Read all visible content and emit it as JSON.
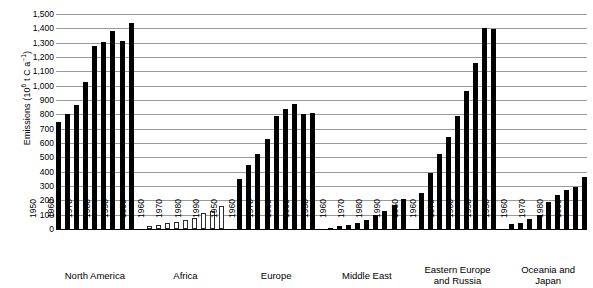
{
  "chart_data": {
    "type": "bar",
    "title": "",
    "xlabel": "",
    "ylabel": "Emissions (10⁶ t C a⁻¹)",
    "ylim": [
      0,
      1500
    ],
    "yticks": [
      "0",
      "100",
      "200",
      "300",
      "400",
      "500",
      "600",
      "700",
      "800",
      "900",
      "1,000",
      "1,100",
      "1,200",
      "1,300",
      "1,400",
      "1,500"
    ],
    "grid": true,
    "legend": "none",
    "categories": [
      "1950",
      "1955",
      "1960",
      "1965",
      "1970",
      "1975",
      "1980",
      "1985",
      "1990"
    ],
    "tick_labels": [
      "1950",
      "1960",
      "1970",
      "1980",
      "1990"
    ],
    "panels": [
      {
        "name": "North America",
        "caption_lines": [
          "North America"
        ],
        "bar_style": "filled",
        "values": [
          750,
          800,
          865,
          1025,
          1275,
          1305,
          1380,
          1315,
          1435
        ]
      },
      {
        "name": "Africa",
        "caption_lines": [
          "Africa"
        ],
        "bar_style": "hollow",
        "values": [
          20,
          30,
          40,
          50,
          65,
          80,
          110,
          125,
          160
        ]
      },
      {
        "name": "Europe",
        "caption_lines": [
          "Europe"
        ],
        "bar_style": "filled",
        "values": [
          350,
          445,
          520,
          625,
          790,
          835,
          875,
          800,
          810
        ]
      },
      {
        "name": "Middle East",
        "caption_lines": [
          "Middle East"
        ],
        "bar_style": "filled",
        "values": [
          10,
          20,
          30,
          45,
          60,
          95,
          125,
          165,
          210
        ]
      },
      {
        "name": "Eastern Europe and Russia",
        "caption_lines": [
          "Eastern Europe",
          "and Russia"
        ],
        "bar_style": "filled",
        "values": [
          250,
          390,
          525,
          640,
          790,
          960,
          1155,
          1400,
          1395
        ]
      },
      {
        "name": "Oceania and Japan",
        "caption_lines": [
          "Oceania and",
          "Japan"
        ],
        "bar_style": "filled",
        "values": [
          35,
          45,
          70,
          100,
          190,
          235,
          275,
          290,
          360
        ]
      }
    ]
  }
}
